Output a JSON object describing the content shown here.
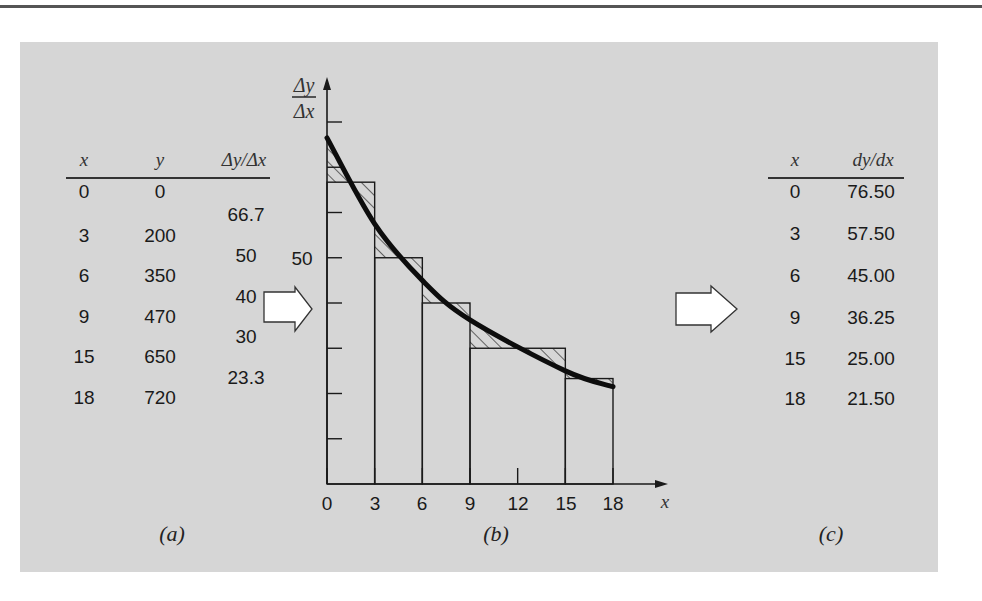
{
  "panel_a": {
    "headers": {
      "x": "x",
      "y": "y",
      "slope": "Δy/Δx"
    },
    "rows": [
      {
        "x": "0",
        "y": "0"
      },
      {
        "x": "3",
        "y": "200"
      },
      {
        "x": "6",
        "y": "350"
      },
      {
        "x": "9",
        "y": "470"
      },
      {
        "x": "15",
        "y": "650"
      },
      {
        "x": "18",
        "y": "720"
      }
    ],
    "slopes": [
      "66.7",
      "50",
      "40",
      "30",
      "23.3"
    ],
    "caption": "(a)"
  },
  "panel_b": {
    "y_label_num": "Δy",
    "y_label_den": "Δx",
    "y_tick_label": "50",
    "x_label": "x",
    "x_ticks": [
      "0",
      "3",
      "6",
      "9",
      "12",
      "15",
      "18"
    ],
    "caption": "(b)"
  },
  "panel_c": {
    "headers": {
      "x": "x",
      "deriv": "dy/dx"
    },
    "rows": [
      {
        "x": "0",
        "deriv": "76.50"
      },
      {
        "x": "3",
        "deriv": "57.50"
      },
      {
        "x": "6",
        "deriv": "45.00"
      },
      {
        "x": "9",
        "deriv": "36.25"
      },
      {
        "x": "15",
        "deriv": "25.00"
      },
      {
        "x": "18",
        "deriv": "21.50"
      }
    ],
    "caption": "(c)"
  },
  "chart_data": {
    "type": "bar",
    "title": "",
    "xlabel": "x",
    "ylabel": "Δy/Δx",
    "bars": [
      {
        "x0": 0,
        "x1": 3,
        "value": 66.7
      },
      {
        "x0": 3,
        "x1": 6,
        "value": 50
      },
      {
        "x0": 6,
        "x1": 9,
        "value": 40
      },
      {
        "x0": 9,
        "x1": 15,
        "value": 30
      },
      {
        "x0": 15,
        "x1": 18,
        "value": 23.3
      }
    ],
    "curve": {
      "name": "dy/dx",
      "x": [
        0,
        3,
        6,
        9,
        15,
        18
      ],
      "y": [
        76.5,
        57.5,
        45.0,
        36.25,
        25.0,
        21.5
      ]
    },
    "x_ticks": [
      0,
      3,
      6,
      9,
      12,
      15,
      18
    ],
    "y_ticks": [
      10,
      20,
      30,
      40,
      50,
      60,
      70,
      80
    ],
    "y_tick_labels": {
      "50": "50"
    },
    "xlim": [
      0,
      18
    ],
    "ylim": [
      0,
      80
    ],
    "grid": false,
    "hatched_regions": "difference between curve and bar tops"
  },
  "colors": {
    "panel_bg": "#d6d6d6",
    "ink": "#1a1a1a",
    "arrow_fill": "#ffffff"
  }
}
